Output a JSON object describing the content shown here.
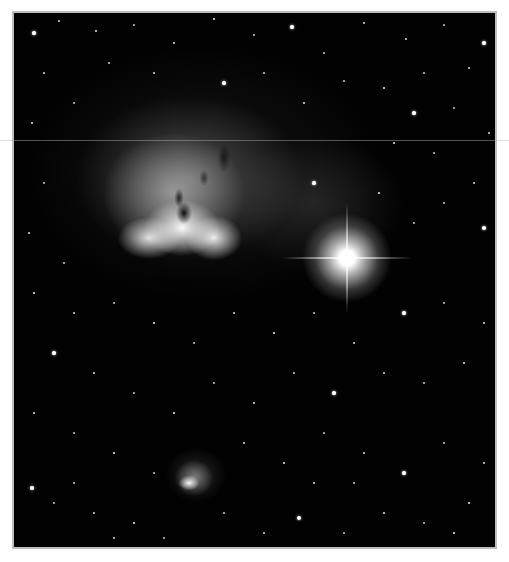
{
  "image": {
    "subject": "Astronomical photograph of an emission nebula with a bright star and a small nebula below",
    "frame_border_color": "#bdbdbd",
    "background_color": "#020202",
    "caption": ""
  },
  "features": {
    "main_nebula": {
      "center": [
        168,
        200
      ],
      "description": "large bright emission nebula with dark lanes"
    },
    "bright_star": {
      "center": [
        345,
        256
      ],
      "description": "bright star with diffraction spikes"
    },
    "small_nebula": {
      "center": [
        190,
        478
      ],
      "description": "small compact nebula"
    }
  },
  "stars": [
    [
      20,
      20,
      1.6
    ],
    [
      45,
      8,
      1.2
    ],
    [
      82,
      18,
      1.4
    ],
    [
      120,
      12,
      1
    ],
    [
      160,
      30,
      1.2
    ],
    [
      200,
      6,
      1.4
    ],
    [
      240,
      22,
      1
    ],
    [
      278,
      14,
      1.6
    ],
    [
      310,
      40,
      1
    ],
    [
      350,
      10,
      1.2
    ],
    [
      392,
      26,
      1.4
    ],
    [
      430,
      12,
      1
    ],
    [
      470,
      30,
      1.6
    ],
    [
      455,
      55,
      1.2
    ],
    [
      410,
      60,
      1
    ],
    [
      370,
      75,
      1.4
    ],
    [
      330,
      68,
      1
    ],
    [
      290,
      90,
      1.2
    ],
    [
      250,
      60,
      1
    ],
    [
      210,
      70,
      1.6
    ],
    [
      30,
      60,
      1.2
    ],
    [
      60,
      90,
      1
    ],
    [
      18,
      110,
      1.4
    ],
    [
      95,
      50,
      1
    ],
    [
      140,
      60,
      1.2
    ],
    [
      400,
      100,
      1.6
    ],
    [
      440,
      95,
      1
    ],
    [
      475,
      120,
      1.2
    ],
    [
      420,
      140,
      1
    ],
    [
      380,
      130,
      1.4
    ],
    [
      460,
      170,
      1.2
    ],
    [
      430,
      190,
      1
    ],
    [
      470,
      215,
      1.8
    ],
    [
      400,
      210,
      1
    ],
    [
      365,
      180,
      1.4
    ],
    [
      300,
      170,
      1.6
    ],
    [
      30,
      170,
      1
    ],
    [
      15,
      220,
      1.2
    ],
    [
      50,
      250,
      1
    ],
    [
      20,
      280,
      1.4
    ],
    [
      60,
      300,
      1.2
    ],
    [
      100,
      290,
      1
    ],
    [
      140,
      310,
      1.4
    ],
    [
      180,
      330,
      1
    ],
    [
      220,
      300,
      1.2
    ],
    [
      260,
      320,
      1.4
    ],
    [
      300,
      300,
      1
    ],
    [
      340,
      330,
      1.2
    ],
    [
      390,
      300,
      1.6
    ],
    [
      430,
      290,
      1
    ],
    [
      470,
      310,
      1.2
    ],
    [
      450,
      350,
      1.4
    ],
    [
      410,
      370,
      1
    ],
    [
      370,
      360,
      1.2
    ],
    [
      320,
      380,
      1.6
    ],
    [
      280,
      360,
      1
    ],
    [
      240,
      390,
      1.2
    ],
    [
      200,
      370,
      1
    ],
    [
      160,
      400,
      1.4
    ],
    [
      120,
      380,
      1
    ],
    [
      80,
      360,
      1.2
    ],
    [
      40,
      340,
      1.6
    ],
    [
      20,
      400,
      1.2
    ],
    [
      60,
      420,
      1
    ],
    [
      100,
      440,
      1.4
    ],
    [
      140,
      460,
      1
    ],
    [
      230,
      430,
      1.2
    ],
    [
      270,
      450,
      1.4
    ],
    [
      310,
      420,
      1
    ],
    [
      350,
      440,
      1.2
    ],
    [
      390,
      460,
      1.6
    ],
    [
      430,
      430,
      1
    ],
    [
      470,
      450,
      1.2
    ],
    [
      455,
      490,
      1.4
    ],
    [
      410,
      510,
      1
    ],
    [
      370,
      500,
      1.2
    ],
    [
      330,
      520,
      1
    ],
    [
      285,
      505,
      2
    ],
    [
      250,
      520,
      1.2
    ],
    [
      210,
      500,
      1
    ],
    [
      120,
      510,
      1.4
    ],
    [
      80,
      500,
      1.2
    ],
    [
      40,
      490,
      1
    ],
    [
      18,
      475,
      1.8
    ],
    [
      60,
      470,
      1
    ],
    [
      100,
      525,
      1.2
    ],
    [
      150,
      525,
      1
    ],
    [
      300,
      470,
      1.2
    ],
    [
      340,
      470,
      1
    ],
    [
      440,
      520,
      1.4
    ]
  ]
}
